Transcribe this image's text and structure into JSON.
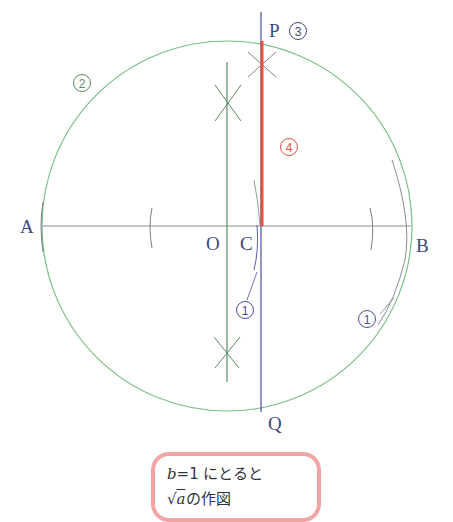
{
  "figure": {
    "points": {
      "A": "A",
      "B": "B",
      "O": "O",
      "C": "C",
      "P": "P",
      "Q": "Q"
    },
    "steps": {
      "step1_left": "1",
      "step1_right": "1",
      "step2": "2",
      "step3": "3",
      "step4": "4"
    },
    "colors": {
      "circle": "#7bbf86",
      "bisector": "#5b8a63",
      "perpendicular": "#4a4f9a",
      "result_segment": "#e2533f",
      "axis": "#8a8f96",
      "arc": "#7a7f86",
      "note_border": "#f2a4a4",
      "label": "#3d4a7a",
      "step4_color": "#e2533f"
    }
  },
  "note": {
    "line1_var": "b",
    "line1_rest": "=1 にとると",
    "line2_sqrt": "√",
    "line2_var": "a",
    "line2_rest": "の作図"
  }
}
